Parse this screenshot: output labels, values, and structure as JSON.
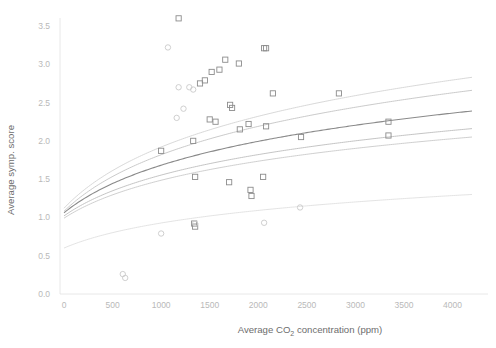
{
  "chart_data": {
    "type": "scatter",
    "title": "",
    "xlabel": "Average CO2 concentration (ppm)",
    "xlabel_parts": {
      "pre": "Average CO",
      "sub": "2",
      "post": " concentration (ppm)"
    },
    "ylabel": "Average symp. score",
    "xlim": [
      0,
      4200
    ],
    "ylim": [
      0.0,
      3.7
    ],
    "xticks": [
      0,
      500,
      1000,
      1500,
      2000,
      2500,
      3000,
      3500,
      4000
    ],
    "xticklabels": [
      "0",
      "500",
      "1000",
      "1500",
      "2000",
      "2500",
      "3000",
      "3500",
      "4000"
    ],
    "yticks": [
      0.0,
      0.5,
      1.0,
      1.5,
      2.0,
      2.5,
      3.0,
      3.5
    ],
    "yticklabels": [
      "0.0",
      "0.5",
      "1.0",
      "1.5",
      "2.0",
      "2.5",
      "3.0",
      "3.5"
    ],
    "grid": false,
    "legend": "none",
    "axis_color": "#e2e2e2",
    "tick_label_color": "#b9b9b9",
    "axis_title_color": "#6d6d6d",
    "series": [
      {
        "name": "square-markers",
        "marker": "square",
        "marker_color": "#8c8c8c",
        "points": [
          {
            "x": 1180,
            "y": 3.6
          },
          {
            "x": 1660,
            "y": 3.06
          },
          {
            "x": 1800,
            "y": 3.01
          },
          {
            "x": 2060,
            "y": 3.21
          },
          {
            "x": 2080,
            "y": 3.21
          },
          {
            "x": 1520,
            "y": 2.9
          },
          {
            "x": 1600,
            "y": 2.93
          },
          {
            "x": 1450,
            "y": 2.79
          },
          {
            "x": 1400,
            "y": 2.75
          },
          {
            "x": 2150,
            "y": 2.62
          },
          {
            "x": 2830,
            "y": 2.62
          },
          {
            "x": 1710,
            "y": 2.47
          },
          {
            "x": 1730,
            "y": 2.43
          },
          {
            "x": 1500,
            "y": 2.28
          },
          {
            "x": 1560,
            "y": 2.25
          },
          {
            "x": 3340,
            "y": 2.25
          },
          {
            "x": 1900,
            "y": 2.22
          },
          {
            "x": 2080,
            "y": 2.19
          },
          {
            "x": 1810,
            "y": 2.15
          },
          {
            "x": 2440,
            "y": 2.05
          },
          {
            "x": 3340,
            "y": 2.07
          },
          {
            "x": 1330,
            "y": 2.0
          },
          {
            "x": 1000,
            "y": 1.87
          },
          {
            "x": 1350,
            "y": 1.53
          },
          {
            "x": 2050,
            "y": 1.53
          },
          {
            "x": 1700,
            "y": 1.46
          },
          {
            "x": 1920,
            "y": 1.36
          },
          {
            "x": 1930,
            "y": 1.28
          },
          {
            "x": 1340,
            "y": 0.92
          },
          {
            "x": 1350,
            "y": 0.88
          }
        ]
      },
      {
        "name": "circle-markers",
        "marker": "circle",
        "marker_color": "#c9c9c9",
        "points": [
          {
            "x": 1070,
            "y": 3.22
          },
          {
            "x": 1330,
            "y": 2.67
          },
          {
            "x": 1180,
            "y": 2.7
          },
          {
            "x": 1290,
            "y": 2.7
          },
          {
            "x": 1230,
            "y": 2.42
          },
          {
            "x": 1160,
            "y": 2.3
          },
          {
            "x": 2430,
            "y": 1.13
          },
          {
            "x": 1000,
            "y": 0.79
          },
          {
            "x": 1350,
            "y": 0.92
          },
          {
            "x": 2060,
            "y": 0.93
          },
          {
            "x": 605,
            "y": 0.26
          },
          {
            "x": 630,
            "y": 0.21
          }
        ]
      }
    ],
    "curves": [
      {
        "name": "fit-curve-1",
        "color": "#d4d4d4",
        "width": 0.9,
        "y0": 1.12,
        "y_end": 2.83,
        "k": 0.0016
      },
      {
        "name": "fit-curve-2",
        "color": "#c4c4c4",
        "width": 0.9,
        "y0": 1.08,
        "y_end": 2.66,
        "k": 0.0016
      },
      {
        "name": "fit-curve-3",
        "color": "#8a8a8a",
        "width": 1.1,
        "y0": 1.06,
        "y_end": 2.39,
        "k": 0.0016
      },
      {
        "name": "fit-curve-4",
        "color": "#bdbdbd",
        "width": 0.9,
        "y0": 1.02,
        "y_end": 2.16,
        "k": 0.0016
      },
      {
        "name": "fit-curve-5",
        "color": "#c9c9c9",
        "width": 0.9,
        "y0": 0.99,
        "y_end": 2.05,
        "k": 0.0016
      },
      {
        "name": "fit-curve-6",
        "color": "#e0e0e0",
        "width": 0.9,
        "y0": 0.6,
        "y_end": 1.3,
        "k": 0.0016
      }
    ]
  }
}
